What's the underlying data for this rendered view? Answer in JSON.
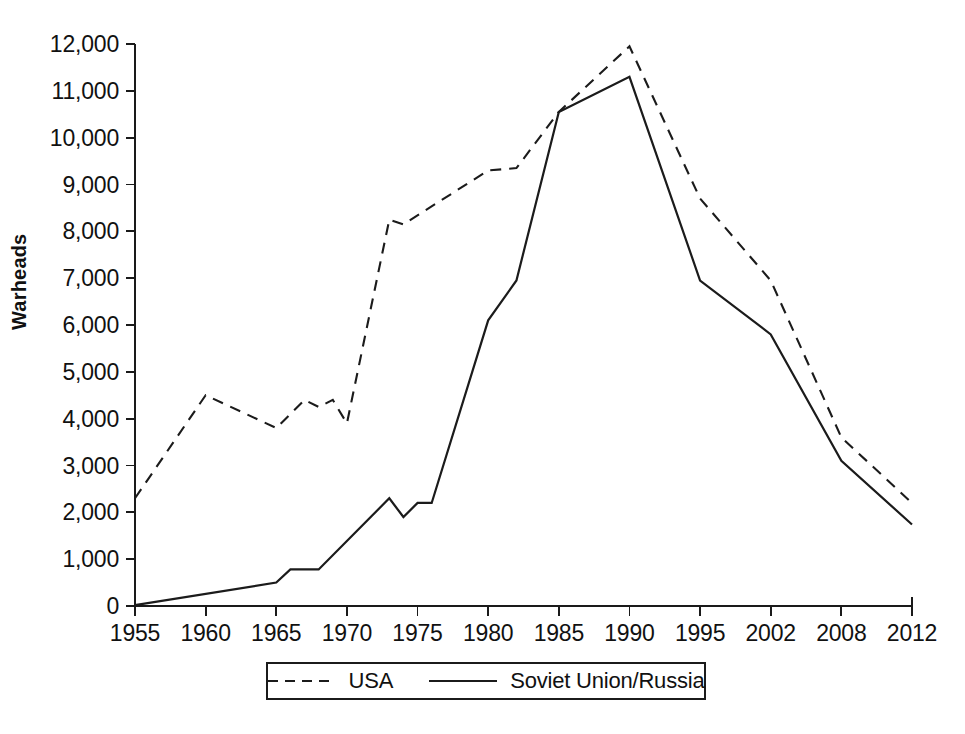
{
  "chart_data": {
    "type": "line",
    "title": "",
    "xlabel": "",
    "ylabel": "Warheads",
    "ylim": [
      0,
      12000
    ],
    "yticks": [
      0,
      1000,
      2000,
      3000,
      4000,
      5000,
      6000,
      7000,
      8000,
      9000,
      10000,
      11000,
      12000
    ],
    "ytick_labels": [
      "0",
      "1,000",
      "2,000",
      "3,000",
      "4,000",
      "5,000",
      "6,000",
      "7,000",
      "8,000",
      "9,000",
      "10,000",
      "11,000",
      "12,000"
    ],
    "xtick_labels": [
      "1955",
      "1960",
      "1965",
      "1970",
      "1975",
      "1980",
      "1985",
      "1990",
      "1995",
      "2002",
      "2008",
      "2012"
    ],
    "xtick_values": [
      1955,
      1960,
      1965,
      1970,
      1975,
      1980,
      1985,
      1990,
      1995,
      2002,
      2008,
      2012
    ],
    "grid": false,
    "legend_position": "bottom",
    "series": [
      {
        "name": "USA",
        "style": "dashed",
        "color": "#1b1b1b",
        "points": [
          [
            1955,
            2300
          ],
          [
            1960,
            4500
          ],
          [
            1965,
            3800
          ],
          [
            1967,
            4400
          ],
          [
            1968,
            4250
          ],
          [
            1969,
            4400
          ],
          [
            1970,
            3900
          ],
          [
            1973,
            8250
          ],
          [
            1974,
            8150
          ],
          [
            1980,
            9300
          ],
          [
            1982,
            9350
          ],
          [
            1985,
            10550
          ],
          [
            1990,
            11950
          ],
          [
            1995,
            8700
          ],
          [
            2002,
            6950
          ],
          [
            2008,
            3600
          ],
          [
            2012,
            2200
          ]
        ]
      },
      {
        "name": "Soviet Union/Russia",
        "style": "solid",
        "color": "#1b1b1b",
        "points": [
          [
            1955,
            20
          ],
          [
            1965,
            500
          ],
          [
            1966,
            780
          ],
          [
            1968,
            780
          ],
          [
            1973,
            2300
          ],
          [
            1974,
            1900
          ],
          [
            1975,
            2200
          ],
          [
            1976,
            2200
          ],
          [
            1980,
            6100
          ],
          [
            1982,
            6950
          ],
          [
            1985,
            10550
          ],
          [
            1990,
            11300
          ],
          [
            1995,
            6950
          ],
          [
            2002,
            5800
          ],
          [
            2008,
            3100
          ],
          [
            2012,
            1740
          ]
        ]
      }
    ]
  },
  "legend": {
    "items": [
      {
        "label": "USA",
        "style": "dashed"
      },
      {
        "label": "Soviet Union/Russia",
        "style": "solid"
      }
    ]
  },
  "axis": {
    "y_title": "Warheads"
  }
}
